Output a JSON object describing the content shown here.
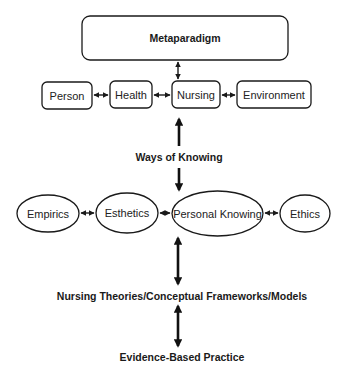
{
  "diagram": {
    "metaparadigm": {
      "label": "Metaparadigm"
    },
    "concepts": [
      {
        "label": "Person"
      },
      {
        "label": "Health"
      },
      {
        "label": "Nursing"
      },
      {
        "label": "Environment"
      }
    ],
    "ways_of_knowing": {
      "label": "Ways of Knowing",
      "patterns": [
        {
          "label": "Empirics"
        },
        {
          "label": "Esthetics"
        },
        {
          "label": "Personal Knowing"
        },
        {
          "label": "Ethics"
        }
      ]
    },
    "theories": {
      "label": "Nursing Theories/Conceptual Frameworks/Models"
    },
    "practice": {
      "label": "Evidence-Based Practice"
    },
    "colors": {
      "stroke": "#1a1a1a",
      "text": "#222222",
      "background": "#ffffff"
    }
  }
}
